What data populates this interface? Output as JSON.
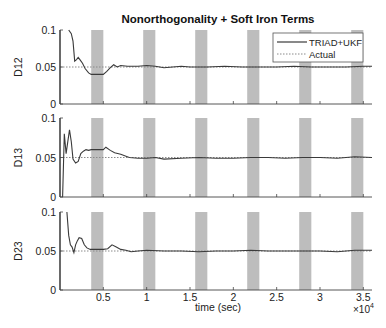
{
  "chart_data": {
    "type": "line",
    "title": "Nonorthogonality + Soft Iron Terms",
    "xlabel": "time (sec)",
    "x_multiplier_label": "×10",
    "x_multiplier_exp": "4",
    "xlim": [
      0,
      36000
    ],
    "x_ticks": [
      5000,
      10000,
      15000,
      20000,
      25000,
      30000,
      35000
    ],
    "x_tick_labels": [
      "0.5",
      "1",
      "1.5",
      "2",
      "2.5",
      "3",
      "3.5"
    ],
    "shaded_intervals": [
      [
        3600,
        5000
      ],
      [
        9600,
        11000
      ],
      [
        15600,
        17000
      ],
      [
        21600,
        23000
      ],
      [
        27600,
        29000
      ],
      [
        33600,
        35000
      ]
    ],
    "legend": {
      "position": "upper right",
      "entries": [
        "TRIAD+UKF",
        "Actual"
      ]
    },
    "colors": {
      "estimate": "#3a3a3a",
      "actual": "#8a8a8a",
      "shade": "#bdbdbd",
      "axis": "#444444"
    },
    "panels": [
      {
        "ylabel": "D12",
        "ylim": [
          0,
          0.1
        ],
        "y_ticks": [
          0,
          0.05,
          0.1
        ],
        "y_tick_labels": [
          "0",
          "0.05",
          "0.1"
        ],
        "actual": 0.05,
        "series": {
          "name": "TRIAD+UKF",
          "x": [
            1000,
            1300,
            1500,
            1700,
            1900,
            2100,
            2300,
            2600,
            2900,
            3300,
            3600,
            4200,
            5000,
            5400,
            5800,
            6200,
            6600,
            7000,
            7800,
            9000,
            10000,
            11000,
            12000,
            13000,
            14000,
            15000,
            17000,
            19000,
            21000,
            23000,
            25000,
            27000,
            29000,
            31000,
            33000,
            35000,
            36000
          ],
          "y": [
            0.1,
            0.095,
            0.085,
            0.058,
            0.06,
            0.063,
            0.06,
            0.055,
            0.048,
            0.042,
            0.04,
            0.04,
            0.04,
            0.044,
            0.049,
            0.053,
            0.05,
            0.052,
            0.051,
            0.051,
            0.052,
            0.051,
            0.049,
            0.05,
            0.051,
            0.05,
            0.05,
            0.051,
            0.05,
            0.05,
            0.05,
            0.051,
            0.05,
            0.05,
            0.05,
            0.051,
            0.051
          ]
        }
      },
      {
        "ylabel": "D13",
        "ylim": [
          0,
          0.1
        ],
        "y_ticks": [
          0,
          0.05,
          0.1
        ],
        "y_tick_labels": [
          "0",
          "0.05",
          "0.1"
        ],
        "actual": 0.05,
        "series": {
          "name": "TRIAD+UKF",
          "x": [
            300,
            500,
            700,
            900,
            1100,
            1300,
            1500,
            1800,
            2100,
            2400,
            2700,
            3000,
            3300,
            3600,
            4200,
            5000,
            5300,
            5800,
            6300,
            7000,
            8000,
            9000,
            10000,
            11000,
            12000,
            14000,
            16000,
            18000,
            20000,
            22000,
            24000,
            26000,
            28000,
            30000,
            32000,
            34000,
            36000
          ],
          "y": [
            0.0,
            0.08,
            0.055,
            0.07,
            0.085,
            0.07,
            0.048,
            0.043,
            0.045,
            0.055,
            0.058,
            0.06,
            0.059,
            0.06,
            0.06,
            0.06,
            0.063,
            0.059,
            0.056,
            0.054,
            0.05,
            0.049,
            0.049,
            0.05,
            0.048,
            0.049,
            0.05,
            0.049,
            0.049,
            0.05,
            0.05,
            0.049,
            0.05,
            0.05,
            0.049,
            0.051,
            0.05
          ]
        }
      },
      {
        "ylabel": "D23",
        "ylim": [
          0,
          0.1
        ],
        "y_ticks": [
          0,
          0.05,
          0.1
        ],
        "y_tick_labels": [
          "0",
          "0.05",
          "0.1"
        ],
        "actual": 0.05,
        "series": {
          "name": "TRIAD+UKF",
          "x": [
            800,
            1000,
            1200,
            1400,
            1600,
            1800,
            2000,
            2200,
            2500,
            2800,
            3100,
            3500,
            4000,
            5000,
            5500,
            6000,
            6500,
            7000,
            7600,
            8200,
            9000,
            10000,
            12000,
            14000,
            16000,
            18000,
            20000,
            22000,
            24000,
            26000,
            28000,
            30000,
            32000,
            34000,
            36000
          ],
          "y": [
            0.1,
            0.07,
            0.058,
            0.055,
            0.048,
            0.058,
            0.063,
            0.067,
            0.066,
            0.058,
            0.054,
            0.052,
            0.052,
            0.052,
            0.053,
            0.058,
            0.055,
            0.052,
            0.051,
            0.049,
            0.05,
            0.051,
            0.05,
            0.05,
            0.049,
            0.05,
            0.05,
            0.051,
            0.05,
            0.05,
            0.05,
            0.05,
            0.049,
            0.051,
            0.051
          ]
        }
      }
    ]
  }
}
